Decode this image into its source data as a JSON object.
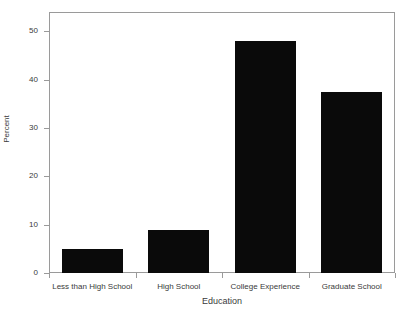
{
  "chart_data": {
    "type": "bar",
    "title": "",
    "subtitle": "",
    "xlabel": "Education",
    "ylabel": "Percent",
    "categories": [
      "Less than High School",
      "High School",
      "College Experience",
      "Graduate School"
    ],
    "values": [
      5,
      9,
      48,
      37.5
    ],
    "ylim": [
      0,
      54
    ],
    "yticks": [
      0,
      10,
      20,
      30,
      40,
      50
    ],
    "ytick_labels": [
      "0",
      "10",
      "20",
      "30",
      "40",
      "50"
    ],
    "grid": false,
    "legend": false,
    "legend_position": "none",
    "bar_color": "#0a0a0a",
    "frame_color": "#9a9a9a",
    "background_color": "#ffffff",
    "annotations": []
  }
}
